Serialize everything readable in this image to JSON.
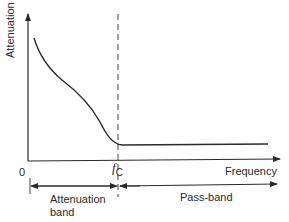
{
  "diagram": {
    "type": "low-pass filter attenuation characteristic",
    "y_axis": {
      "label": "Attenuation"
    },
    "x_axis": {
      "label": "Frequency",
      "origin_label": "0"
    },
    "cutoff": {
      "symbol": "f",
      "subscript": "C"
    },
    "bands": [
      {
        "label_line1": "Attenuation",
        "label_line2": "band"
      },
      {
        "label": "Pass-band"
      }
    ],
    "colors": {
      "line": "#2a2a2a",
      "background": "#ffffff"
    }
  }
}
